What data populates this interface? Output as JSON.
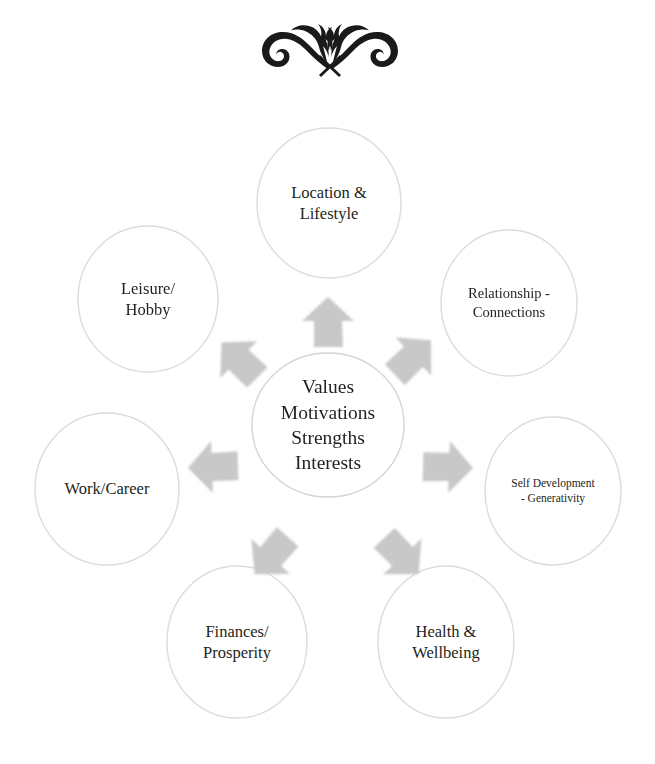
{
  "page": {
    "background_color": "#ffffff",
    "text_color": "#231f20",
    "ornament_name": "decorative-flourish-divider",
    "ornament_color": "#1a1a1a"
  },
  "diagram": {
    "type": "hub-and-spoke",
    "circle_fill": "#ffffff",
    "circle_stroke": "#d8d8d8",
    "arrow_fill": "#c9c9c9",
    "center": {
      "id": "center-core",
      "lines": [
        "Values",
        "Motivations",
        "Strengths",
        "Interests"
      ],
      "text": "Values Motivations Strengths Interests"
    },
    "nodes": [
      {
        "id": "location-lifestyle",
        "lines": [
          "Location &",
          "Lifestyle"
        ],
        "text": "Location & Lifestyle",
        "position": "top"
      },
      {
        "id": "relationship-connections",
        "lines": [
          "Relationship -",
          "Connections"
        ],
        "text": "Relationship - Connections",
        "position": "upper-right"
      },
      {
        "id": "self-development-generativity",
        "lines": [
          "Self Development",
          "-  Generativity"
        ],
        "text": "Self Development - Generativity",
        "position": "right"
      },
      {
        "id": "health-wellbeing",
        "lines": [
          "Health &",
          "Wellbeing"
        ],
        "text": "Health & Wellbeing",
        "position": "lower-right"
      },
      {
        "id": "finances-prosperity",
        "lines": [
          "Finances/",
          "Prosperity"
        ],
        "text": "Finances/ Prosperity",
        "position": "lower-left"
      },
      {
        "id": "work-career",
        "lines": [
          "Work/Career"
        ],
        "text": "Work/Career",
        "position": "left"
      },
      {
        "id": "leisure-hobby",
        "lines": [
          "Leisure/",
          "Hobby"
        ],
        "text": "Leisure/ Hobby",
        "position": "upper-left"
      }
    ],
    "arrows": [
      {
        "id": "arrow-to-location-lifestyle",
        "points_to": "location-lifestyle",
        "direction": "up"
      },
      {
        "id": "arrow-to-relationship-connections",
        "points_to": "relationship-connections",
        "direction": "up-right"
      },
      {
        "id": "arrow-to-self-development",
        "points_to": "self-development-generativity",
        "direction": "right"
      },
      {
        "id": "arrow-to-health-wellbeing",
        "points_to": "health-wellbeing",
        "direction": "down-right"
      },
      {
        "id": "arrow-to-finances-prosperity",
        "points_to": "finances-prosperity",
        "direction": "down-left"
      },
      {
        "id": "arrow-to-work-career",
        "points_to": "work-career",
        "direction": "left"
      },
      {
        "id": "arrow-to-leisure-hobby",
        "points_to": "leisure-hobby",
        "direction": "up-left"
      }
    ]
  }
}
